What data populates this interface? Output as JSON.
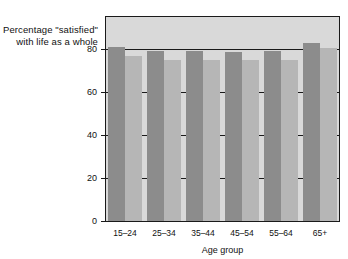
{
  "chart_data": {
    "type": "bar",
    "title": "",
    "ylabel": "Percentage \"satisfied\" with life as a whole",
    "ylabel_lines": [
      "Percentage \"satisfied\"",
      "with life as a whole"
    ],
    "xlabel": "Age group",
    "categories": [
      "15–24",
      "25–34",
      "35–44",
      "45–54",
      "55–64",
      "65+"
    ],
    "series": [
      {
        "name": "series-1",
        "color": "#8c8c8c",
        "values": [
          81,
          79,
          79,
          78.5,
          79,
          83
        ]
      },
      {
        "name": "series-2",
        "color": "#b6b6b6",
        "values": [
          77,
          75,
          75,
          75,
          75,
          80.5
        ]
      }
    ],
    "ylim": [
      0,
      95
    ],
    "yticks": [
      0,
      20,
      40,
      60,
      80
    ],
    "ytick_labels": [
      "0",
      "20",
      "40",
      "60",
      "80"
    ],
    "grid": true,
    "grid_axis": "y",
    "legend": "none",
    "plot_background": "#d9d9d9",
    "axis_color": "#1a1a1a"
  }
}
